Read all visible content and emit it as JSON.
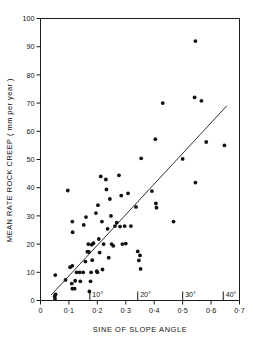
{
  "chart_data": {
    "type": "scatter",
    "title": "",
    "xlabel": "SINE OF SLOPE ANGLE",
    "ylabel": "MEAN RATE ROCK CREEP ( mm per year )",
    "xlim": [
      0,
      0.7
    ],
    "ylim": [
      0,
      100
    ],
    "grid": false,
    "legend": null,
    "x_ticks": [
      0,
      0.1,
      0.2,
      0.3,
      0.4,
      0.5,
      0.6,
      0.7
    ],
    "x_tick_labels": [
      "0",
      "0·1",
      "0·2",
      "0·3",
      "0·4",
      "0·5",
      "0·6",
      "0·7"
    ],
    "y_ticks": [
      0,
      10,
      20,
      30,
      40,
      50,
      60,
      70,
      80,
      90,
      100
    ],
    "y_tick_labels": [
      "0",
      "10",
      "20",
      "30",
      "40",
      "50",
      "60",
      "70",
      "80",
      "90",
      "100"
    ],
    "angle_markers": [
      {
        "label": "10°",
        "x": 0.1736
      },
      {
        "label": "20°",
        "x": 0.342
      },
      {
        "label": "30°",
        "x": 0.5
      },
      {
        "label": "40°",
        "x": 0.6428
      }
    ],
    "fit_line": {
      "name": "regression line",
      "x0": 0.038,
      "y0": 2.0,
      "x1": 0.655,
      "y1": 69.0
    },
    "points": [
      [
        0.052,
        9.0
      ],
      [
        0.05,
        1.5
      ],
      [
        0.051,
        0.6
      ],
      [
        0.053,
        2.2
      ],
      [
        0.088,
        7.3
      ],
      [
        0.096,
        39.0
      ],
      [
        0.104,
        11.8
      ],
      [
        0.112,
        12.3
      ],
      [
        0.112,
        28.0
      ],
      [
        0.113,
        24.2
      ],
      [
        0.11,
        6.0
      ],
      [
        0.112,
        4.2
      ],
      [
        0.12,
        4.2
      ],
      [
        0.122,
        7.0
      ],
      [
        0.127,
        10.0
      ],
      [
        0.138,
        10.0
      ],
      [
        0.14,
        6.8
      ],
      [
        0.15,
        10.0
      ],
      [
        0.152,
        26.8
      ],
      [
        0.158,
        13.8
      ],
      [
        0.16,
        29.6
      ],
      [
        0.165,
        17.3
      ],
      [
        0.168,
        20.0
      ],
      [
        0.17,
        17.2
      ],
      [
        0.172,
        3.2
      ],
      [
        0.176,
        6.8
      ],
      [
        0.178,
        10.0
      ],
      [
        0.18,
        19.8
      ],
      [
        0.182,
        14.3
      ],
      [
        0.186,
        20.3
      ],
      [
        0.195,
        31.0
      ],
      [
        0.198,
        10.4
      ],
      [
        0.2,
        10.0
      ],
      [
        0.202,
        33.8
      ],
      [
        0.205,
        21.8
      ],
      [
        0.208,
        17.0
      ],
      [
        0.212,
        44.0
      ],
      [
        0.216,
        28.0
      ],
      [
        0.218,
        11.0
      ],
      [
        0.222,
        20.0
      ],
      [
        0.23,
        42.9
      ],
      [
        0.232,
        39.4
      ],
      [
        0.236,
        25.4
      ],
      [
        0.24,
        15.2
      ],
      [
        0.244,
        36.0
      ],
      [
        0.248,
        30.0
      ],
      [
        0.25,
        20.0
      ],
      [
        0.256,
        19.4
      ],
      [
        0.262,
        26.4
      ],
      [
        0.268,
        27.6
      ],
      [
        0.276,
        44.4
      ],
      [
        0.28,
        26.2
      ],
      [
        0.284,
        37.2
      ],
      [
        0.288,
        20.0
      ],
      [
        0.296,
        26.4
      ],
      [
        0.3,
        20.2
      ],
      [
        0.308,
        38.0
      ],
      [
        0.318,
        26.4
      ],
      [
        0.336,
        33.2
      ],
      [
        0.342,
        17.4
      ],
      [
        0.346,
        14.2
      ],
      [
        0.35,
        16.0
      ],
      [
        0.352,
        11.2
      ],
      [
        0.354,
        50.4
      ],
      [
        0.392,
        38.8
      ],
      [
        0.404,
        57.2
      ],
      [
        0.406,
        34.4
      ],
      [
        0.408,
        32.9
      ],
      [
        0.43,
        70.0
      ],
      [
        0.468,
        28.0
      ],
      [
        0.5,
        50.2
      ],
      [
        0.545,
        92.0
      ],
      [
        0.542,
        72.0
      ],
      [
        0.545,
        41.8
      ],
      [
        0.566,
        70.8
      ],
      [
        0.583,
        56.2
      ],
      [
        0.647,
        55.0
      ]
    ]
  },
  "figure": {
    "caption": ""
  }
}
